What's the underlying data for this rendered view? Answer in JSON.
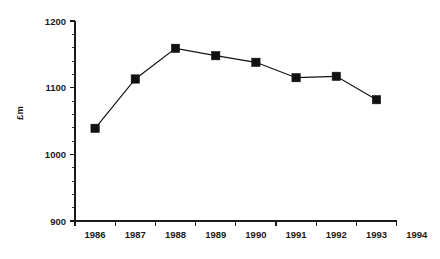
{
  "chart_data": {
    "type": "line",
    "title": "",
    "subtitle": "",
    "xlabel": "",
    "ylabel": "£m",
    "x": [
      1986.5,
      1987.5,
      1988.5,
      1989.5,
      1990.5,
      1991.5,
      1992.5,
      1993.5
    ],
    "values": [
      1039,
      1113,
      1159,
      1148,
      1138,
      1115,
      1117,
      1082
    ],
    "series": [
      {
        "name": "£m",
        "values": [
          1039,
          1113,
          1159,
          1148,
          1138,
          1115,
          1117,
          1082
        ]
      }
    ],
    "categories": [
      "1986",
      "1987",
      "1988",
      "1989",
      "1990",
      "1991",
      "1992",
      "1993"
    ],
    "xlim": [
      1986,
      1994
    ],
    "ylim": [
      900,
      1200
    ],
    "x_tick_labels": [
      "1986",
      "1987",
      "1988",
      "1989",
      "1990",
      "1991",
      "1992",
      "1993",
      "1994"
    ],
    "x_tick_values": [
      1986,
      1987,
      1988,
      1989,
      1990,
      1991,
      1992,
      1993,
      1994
    ],
    "x_labels_offset": true,
    "y_tick_labels": [
      "900",
      "1000",
      "1100",
      "1200"
    ],
    "y_tick_values": [
      900,
      1000,
      1100,
      1200
    ],
    "y_minor_step": 20,
    "grid": false,
    "legend": "none",
    "marker": "square",
    "line_color": "#111111",
    "marker_color": "#111111",
    "axis_color": "#1a1a1a",
    "background_color": "#ffffff",
    "annotations": []
  },
  "labels": {
    "y_axis_title": "£m",
    "y_ticks": [
      "1200",
      "1100",
      "1000",
      "900"
    ],
    "x_ticks": [
      "1986",
      "1987",
      "1988",
      "1989",
      "1990",
      "1991",
      "1992",
      "1993",
      "1994"
    ]
  }
}
